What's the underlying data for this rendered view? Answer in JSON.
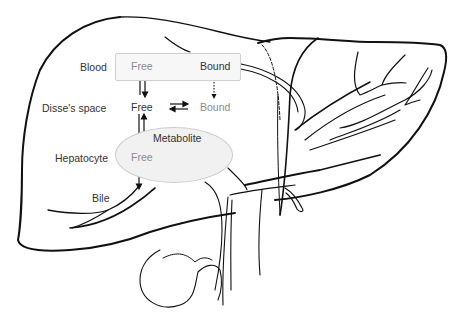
{
  "diagram": {
    "rows": {
      "blood": "Blood",
      "disse": "Disse's space",
      "hepatocyte": "Hepatocyte",
      "bile": "Bile"
    },
    "nodes": {
      "blood_free": "Free",
      "blood_bound": "Bound",
      "disse_free": "Free",
      "disse_bound": "Bound",
      "hep_free": "Free",
      "metabolite": "Metabolite"
    },
    "edges": [
      {
        "from": "blood_free",
        "to": "blood_bound",
        "type": "equilibrium"
      },
      {
        "from": "disse_free",
        "to": "disse_bound",
        "type": "equilibrium"
      },
      {
        "from": "blood_free",
        "to": "disse_free",
        "type": "bidirectional"
      },
      {
        "from": "disse_free",
        "to": "hep_free",
        "type": "bidirectional"
      },
      {
        "from": "blood_bound",
        "to": "disse_bound",
        "type": "dotted"
      },
      {
        "from": "hep_free",
        "to": "metabolite",
        "type": "curved"
      },
      {
        "from": "hep_free",
        "to": "bile",
        "type": "arrow"
      }
    ],
    "colors": {
      "line": "#111111",
      "box_fill": "#f7f7f7",
      "box_border": "#cfcfcf",
      "ellipse_fill": "#f1f1f1",
      "label": "#333333",
      "free_text": "#8a8a8a"
    }
  }
}
